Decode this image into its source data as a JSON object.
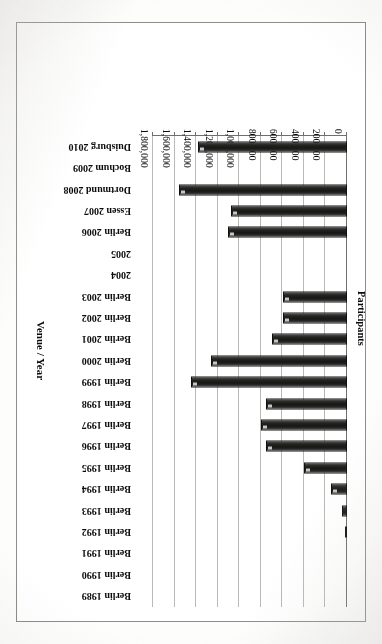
{
  "chart_data": {
    "type": "bar",
    "orientation": "horizontal",
    "title": "",
    "xlabel": "Participants",
    "ylabel": "Venue / Year",
    "xlim": [
      0,
      1800000
    ],
    "grid": true,
    "legend": "none",
    "tick_labels": [
      "0",
      "200,000",
      "400,000",
      "600,000",
      "800,000",
      "1,000,000",
      "1,200,000",
      "1,400,000",
      "1,600,000",
      "1,800,000"
    ],
    "tick_values": [
      0,
      200000,
      400000,
      600000,
      800000,
      1000000,
      1200000,
      1400000,
      1600000,
      1800000
    ],
    "categories": [
      "Berlin 1989",
      "Berlin 1990",
      "Berlin 1991",
      "Berlin 1992",
      "Berlin 1993",
      "Berlin 1994",
      "Berlin 1995",
      "Berlin 1996",
      "Berlin 1997",
      "Berlin 1998",
      "Berlin 1999",
      "Berlin 2000",
      "Berlin 2001",
      "Berlin 2002",
      "Berlin 2003",
      "2004",
      "2005",
      "Berlin 2006",
      "Essen 2007",
      "Dortmund 2008",
      "Bochum 2009",
      "Duisburg 2010"
    ],
    "values": [
      0,
      0,
      0,
      20000,
      50000,
      150000,
      400000,
      750000,
      800000,
      750000,
      1450000,
      1260000,
      700000,
      590000,
      590000,
      0,
      0,
      1100000,
      1080000,
      1560000,
      0,
      1380000
    ]
  },
  "axis": {
    "value_title": "Participants",
    "category_title": "Venue / Year"
  }
}
